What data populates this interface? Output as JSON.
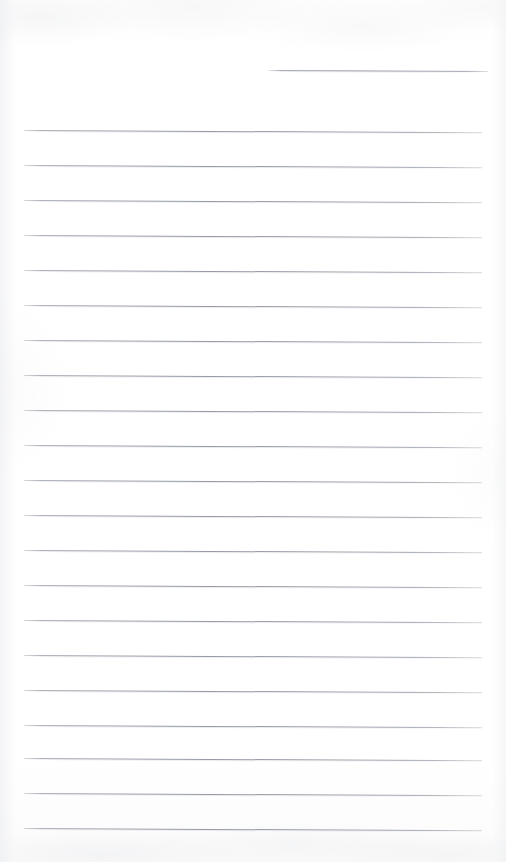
{
  "document": {
    "type": "scanned-lined-paper",
    "title": "Lined notebook page",
    "content_text": "",
    "is_blank": true,
    "page_width": 506,
    "page_height": 862
  },
  "colors": {
    "page_background": "#fefefe",
    "rule_line": "#8e939e",
    "rule_line_halo": "#c6c9d0",
    "scan_grain": "#e6e8ec"
  },
  "ruling": {
    "line_spacing": 35,
    "line_thickness": 1,
    "tilt_degrees": 0.28,
    "left_margin": 24,
    "right_margin": 482,
    "full_line_count": 21,
    "partial_line_count": 1,
    "lines": [
      {
        "id": "rule-partial-0",
        "y": 70,
        "x_start": 268,
        "x_end": 488,
        "partial": true,
        "label": "partial top rule (right side only)"
      },
      {
        "id": "rule-1",
        "y": 130,
        "x_start": 24,
        "x_end": 482,
        "partial": false,
        "label": "rule 1"
      },
      {
        "id": "rule-2",
        "y": 165,
        "x_start": 24,
        "x_end": 482,
        "partial": false,
        "label": "rule 2"
      },
      {
        "id": "rule-3",
        "y": 200,
        "x_start": 24,
        "x_end": 482,
        "partial": false,
        "label": "rule 3"
      },
      {
        "id": "rule-4",
        "y": 235,
        "x_start": 24,
        "x_end": 482,
        "partial": false,
        "label": "rule 4"
      },
      {
        "id": "rule-5",
        "y": 270,
        "x_start": 24,
        "x_end": 482,
        "partial": false,
        "label": "rule 5"
      },
      {
        "id": "rule-6",
        "y": 305,
        "x_start": 24,
        "x_end": 482,
        "partial": false,
        "label": "rule 6"
      },
      {
        "id": "rule-7",
        "y": 340,
        "x_start": 24,
        "x_end": 482,
        "partial": false,
        "label": "rule 7"
      },
      {
        "id": "rule-8",
        "y": 375,
        "x_start": 24,
        "x_end": 482,
        "partial": false,
        "label": "rule 8"
      },
      {
        "id": "rule-9",
        "y": 410,
        "x_start": 24,
        "x_end": 482,
        "partial": false,
        "label": "rule 9"
      },
      {
        "id": "rule-10",
        "y": 445,
        "x_start": 24,
        "x_end": 482,
        "partial": false,
        "label": "rule 10"
      },
      {
        "id": "rule-11",
        "y": 480,
        "x_start": 24,
        "x_end": 482,
        "partial": false,
        "label": "rule 11"
      },
      {
        "id": "rule-12",
        "y": 515,
        "x_start": 24,
        "x_end": 482,
        "partial": false,
        "label": "rule 12"
      },
      {
        "id": "rule-13",
        "y": 550,
        "x_start": 24,
        "x_end": 482,
        "partial": false,
        "label": "rule 13"
      },
      {
        "id": "rule-14",
        "y": 585,
        "x_start": 24,
        "x_end": 482,
        "partial": false,
        "label": "rule 14"
      },
      {
        "id": "rule-15",
        "y": 620,
        "x_start": 24,
        "x_end": 482,
        "partial": false,
        "label": "rule 15"
      },
      {
        "id": "rule-16",
        "y": 655,
        "x_start": 24,
        "x_end": 482,
        "partial": false,
        "label": "rule 16"
      },
      {
        "id": "rule-17",
        "y": 690,
        "x_start": 24,
        "x_end": 482,
        "partial": false,
        "label": "rule 17"
      },
      {
        "id": "rule-18",
        "y": 725,
        "x_start": 24,
        "x_end": 482,
        "partial": false,
        "label": "rule 18"
      },
      {
        "id": "rule-19",
        "y": 758,
        "x_start": 24,
        "x_end": 482,
        "partial": false,
        "label": "rule 19"
      },
      {
        "id": "rule-20",
        "y": 793,
        "x_start": 24,
        "x_end": 482,
        "partial": false,
        "label": "rule 20"
      },
      {
        "id": "rule-21",
        "y": 828,
        "x_start": 24,
        "x_end": 482,
        "partial": false,
        "label": "rule 21"
      }
    ]
  }
}
